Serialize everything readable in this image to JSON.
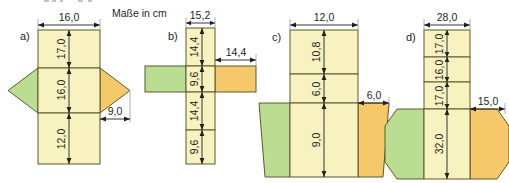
{
  "figure": {
    "unit_note": "Maße in cm",
    "colors": {
      "paper": "#ffffff",
      "yellow_face": "#F7F2C0",
      "green_face": "#BBDD92",
      "orange_face": "#F5C969",
      "outline": "#5b5b2a",
      "dimension": "#231f20",
      "extension": "#9a9a9a"
    },
    "parts": [
      {
        "id": "a",
        "label": "a)",
        "shape": "net-with-rhombus-flaps",
        "width_label": "16,0",
        "segments": [
          "17,0",
          "16,0",
          "12,0"
        ],
        "flap_label": "9,0"
      },
      {
        "id": "b",
        "label": "b)",
        "shape": "net-with-rectangular-flaps",
        "width_label": "15,2",
        "segments": [
          "14,4",
          "9,6",
          "14,4",
          "9,6"
        ],
        "flap_label": "14,4"
      },
      {
        "id": "c",
        "label": "c)",
        "shape": "net-with-trapezoid-flaps",
        "width_label": "12,0",
        "segments": [
          "10,8",
          "6,0",
          "9,0"
        ],
        "flap_label": "6,0"
      },
      {
        "id": "d",
        "label": "d)",
        "shape": "net-with-hexagonal-flaps",
        "width_label": "28,0",
        "segments": [
          "17,0",
          "16,0",
          "17,0",
          "32,0"
        ],
        "flap_label": "15,0"
      }
    ],
    "dimension_texts": {
      "a_width": "16,0",
      "a_s1": "17,0",
      "a_s2": "16,0",
      "a_s3": "12,0",
      "a_flap": "9,0",
      "b_width": "15,2",
      "b_s1": "14,4",
      "b_s2": "9,6",
      "b_s3": "14,4",
      "b_s4": "9,6",
      "b_flap": "14,4",
      "c_width": "12,0",
      "c_s1": "10,8",
      "c_s2": "6,0",
      "c_s3": "9,0",
      "c_flap": "6,0",
      "d_width": "28,0",
      "d_s1": "17,0",
      "d_s2": "16,0",
      "d_s3": "17,0",
      "d_s4": "32,0",
      "d_flap": "15,0"
    }
  }
}
